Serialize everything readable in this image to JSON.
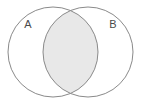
{
  "figure": {
    "type": "venn-diagram",
    "width": 141,
    "height": 107,
    "background_color": "#ffffff",
    "stroke_color": "#8a8a8a",
    "stroke_width": 1,
    "intersection_fill": "#e8e8e8",
    "circle_fill": "#ffffff",
    "label_color": "#4a4a4a"
  },
  "sets": {
    "left": {
      "label": "A",
      "label_x": 28,
      "label_y": 25,
      "center_x": 53,
      "center_y": 52,
      "radius": 45
    },
    "right": {
      "label": "B",
      "label_x": 113,
      "label_y": 25,
      "center_x": 88,
      "center_y": 52,
      "radius": 45
    }
  },
  "intersection": {
    "name": "A-intersect-B",
    "shaded": true,
    "top_crossing_x": 70.5,
    "top_crossing_y": 5,
    "bottom_crossing_x": 70.5,
    "bottom_crossing_y": 99,
    "left_extent_x": 43,
    "right_extent_x": 98
  }
}
